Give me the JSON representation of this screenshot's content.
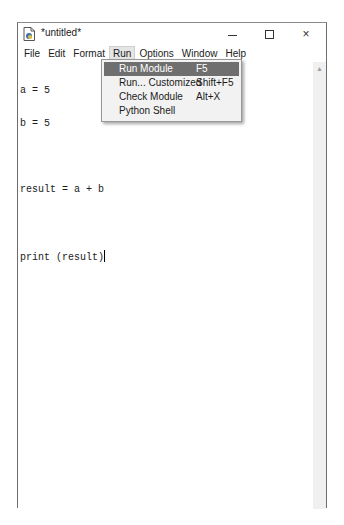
{
  "window": {
    "title": "*untitled*",
    "icon": "idle-file-icon",
    "controls": {
      "minimize": "minimize-icon",
      "maximize": "maximize-icon",
      "close": "×"
    }
  },
  "menubar": {
    "items": [
      {
        "label": "File"
      },
      {
        "label": "Edit"
      },
      {
        "label": "Format"
      },
      {
        "label": "Run",
        "active": true
      },
      {
        "label": "Options"
      },
      {
        "label": "Window"
      },
      {
        "label": "Help"
      }
    ]
  },
  "editor": {
    "lines": [
      "a = 5",
      "b = 5",
      "",
      "result = a + b",
      "",
      "print (result)"
    ]
  },
  "run_menu": {
    "items": [
      {
        "label": "Run Module",
        "accel": "F5",
        "highlighted": true
      },
      {
        "label": "Run... Customized",
        "accel": "Shift+F5"
      },
      {
        "label": "Check Module",
        "accel": "Alt+X"
      },
      {
        "label": "Python Shell",
        "accel": ""
      }
    ]
  },
  "scrollbar": {
    "up_arrow": "▲"
  },
  "colors": {
    "highlight_bg": "#6f6f6f",
    "menu_bg": "#f2f2f2",
    "active_menu_bg": "#e5e5e5"
  }
}
